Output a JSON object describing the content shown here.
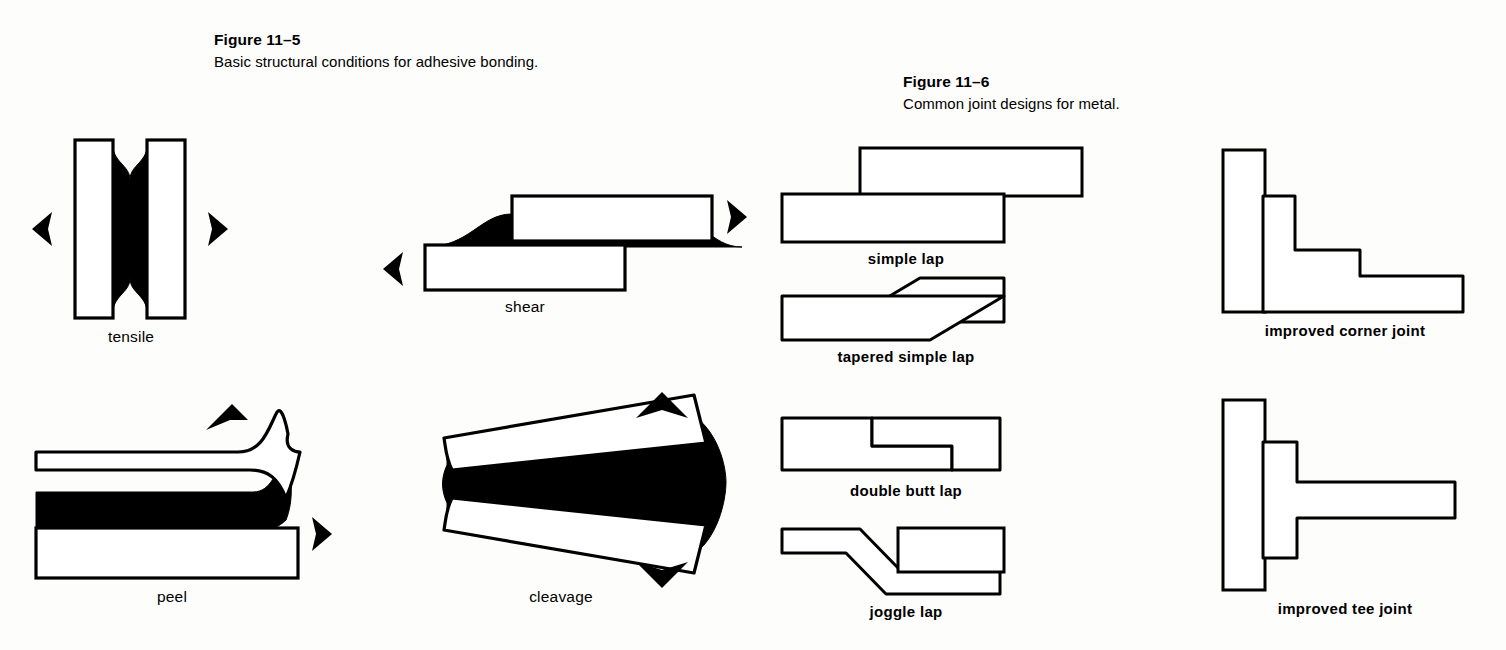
{
  "figures": [
    {
      "id": "figure-11-5",
      "number": "Figure 11–5",
      "caption": "Basic structural conditions for adhesive bonding.",
      "diagrams": [
        {
          "id": "tensile",
          "label": "tensile",
          "arrows": [
            "left",
            "right"
          ]
        },
        {
          "id": "shear",
          "label": "shear",
          "arrows": [
            "left",
            "right"
          ]
        },
        {
          "id": "peel",
          "label": "peel",
          "arrows": [
            "up-right",
            "right"
          ]
        },
        {
          "id": "cleavage",
          "label": "cleavage",
          "arrows": [
            "up",
            "down"
          ]
        }
      ]
    },
    {
      "id": "figure-11-6",
      "number": "Figure 11–6",
      "caption": "Common joint designs for metal.",
      "diagrams": [
        {
          "id": "simple-lap",
          "label": "simple lap"
        },
        {
          "id": "tapered-simple-lap",
          "label": "tapered simple lap"
        },
        {
          "id": "double-butt-lap",
          "label": "double butt lap"
        },
        {
          "id": "joggle-lap",
          "label": "joggle lap"
        },
        {
          "id": "improved-corner-joint",
          "label": "improved corner joint"
        },
        {
          "id": "improved-tee-joint",
          "label": "improved tee joint"
        }
      ]
    }
  ],
  "colors": {
    "ink": "#000000",
    "paper": "#fdfdfc",
    "adhesive_fill": "#000000",
    "metal_fill": "#ffffff"
  }
}
